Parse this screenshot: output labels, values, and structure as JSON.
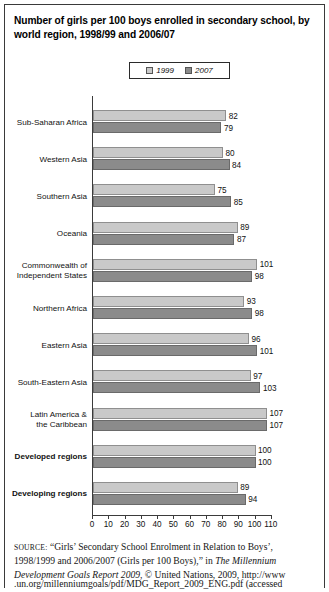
{
  "title": "Number of girls per 100 boys enrolled in secondary school, by world region, 1998/99 and 2006/07",
  "legend": {
    "items": [
      {
        "label": "1999",
        "color": "#c9c9c9",
        "icon": "legend-swatch-light"
      },
      {
        "label": "2007",
        "color": "#8b8b8b",
        "icon": "legend-swatch-dark"
      }
    ]
  },
  "axis": {
    "ticks": [
      "0",
      "10",
      "20",
      "30",
      "40",
      "50",
      "60",
      "70",
      "80",
      "90",
      "100",
      "110"
    ]
  },
  "source": {
    "label": "SOURCE:",
    "line1_pre": " “Girls’ Secondary School Enrolment in Relation to Boys’, 1998/1999 and 2006/2007 (Girls per 100 Boys),” in ",
    "italic1": "The Millennium Development Goals Report 2009",
    "line1_post": ", © United Nations, 2009, http://www",
    "cutoff": ".un.org/millenniumgoals/pdf/MDG_Report_2009_ENG.pdf (accessed"
  },
  "chart_data": {
    "type": "bar",
    "orientation": "horizontal",
    "title": "Number of girls per 100 boys enrolled in secondary school, by world region, 1998/99 and 2006/07",
    "xlabel": "",
    "ylabel": "",
    "xlim": [
      0,
      110
    ],
    "grid": false,
    "legend_position": "top-center",
    "categories": [
      "Sub-Saharan Africa",
      "Western Asia",
      "Southern Asia",
      "Oceania",
      "Commonwealth of Independent States",
      "Northern Africa",
      "Eastern Asia",
      "South-Eastern Asia",
      "Latin America & the Caribbean",
      "Developed regions",
      "Developing regions"
    ],
    "category_lines": [
      [
        "Sub-Saharan Africa"
      ],
      [
        "Western Asia"
      ],
      [
        "Southern Asia"
      ],
      [
        "Oceania"
      ],
      [
        "Commonwealth of",
        "Independent States"
      ],
      [
        "Northern Africa"
      ],
      [
        "Eastern Asia"
      ],
      [
        "South-Eastern Asia"
      ],
      [
        "Latin America &",
        "the Caribbean"
      ],
      [
        "Developed regions"
      ],
      [
        "Developing regions"
      ]
    ],
    "category_bold": [
      false,
      false,
      false,
      false,
      false,
      false,
      false,
      false,
      false,
      true,
      true
    ],
    "series": [
      {
        "name": "1999",
        "values": [
          82,
          80,
          75,
          89,
          101,
          93,
          96,
          97,
          107,
          100,
          89
        ]
      },
      {
        "name": "2007",
        "values": [
          79,
          84,
          85,
          87,
          98,
          98,
          101,
          103,
          107,
          100,
          94
        ]
      }
    ]
  }
}
